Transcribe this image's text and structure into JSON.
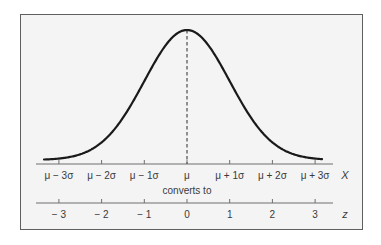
{
  "figure": {
    "colors": {
      "background": "#f4f4f4",
      "frame": "#5f5f5f",
      "curve": "#1a1a1a",
      "axis": "#6e6e6e",
      "text": "#3a3a3a"
    },
    "x_axis": {
      "variable": "X",
      "ticks": [
        "μ − 3σ",
        "μ − 2σ",
        "μ − 1σ",
        "μ",
        "μ + 1σ",
        "μ + 2σ",
        "μ + 3σ"
      ]
    },
    "connector_label": "converts to",
    "z_axis": {
      "variable": "z",
      "ticks": [
        "− 3",
        "− 2",
        "− 1",
        "0",
        "1",
        "2",
        "3"
      ]
    }
  },
  "chart_data": {
    "type": "line",
    "title": "",
    "curve": "normal (Gaussian) density",
    "x": [
      -3.3,
      -3,
      -2,
      -1,
      0,
      1,
      2,
      3,
      3.3
    ],
    "values_relative": [
      0.0043,
      0.0111,
      0.1353,
      0.6065,
      1.0,
      0.6065,
      0.1353,
      0.0111,
      0.0043
    ],
    "mean_marker": "dashed vertical line at μ (z = 0)",
    "xlabel_top": "X",
    "xlabel_bottom": "z",
    "x_tick_labels_top": [
      "μ − 3σ",
      "μ − 2σ",
      "μ − 1σ",
      "μ",
      "μ + 1σ",
      "μ + 2σ",
      "μ + 3σ"
    ],
    "x_tick_labels_bottom": [
      "− 3",
      "− 2",
      "− 1",
      "0",
      "1",
      "2",
      "3"
    ],
    "xlim": [
      -3.3,
      3.3
    ],
    "grid": false,
    "legend": "none"
  }
}
